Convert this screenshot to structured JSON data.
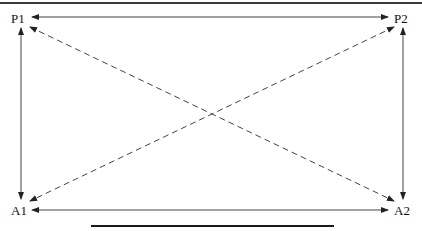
{
  "diagram": {
    "nodes": [
      {
        "id": "P1",
        "label": "P1",
        "x": 21,
        "y": 17
      },
      {
        "id": "P2",
        "label": "P2",
        "x": 403,
        "y": 17
      },
      {
        "id": "A1",
        "label": "A1",
        "x": 21,
        "y": 210
      },
      {
        "id": "A2",
        "label": "A2",
        "x": 403,
        "y": 210
      }
    ],
    "edges": [
      {
        "from": "P1",
        "to": "P2",
        "style": "solid",
        "direction": "both"
      },
      {
        "from": "A1",
        "to": "A2",
        "style": "solid",
        "direction": "both"
      },
      {
        "from": "P1",
        "to": "A1",
        "style": "solid",
        "direction": "both"
      },
      {
        "from": "P2",
        "to": "A2",
        "style": "solid",
        "direction": "both"
      },
      {
        "from": "P1",
        "to": "A2",
        "style": "dashed",
        "direction": "both"
      },
      {
        "from": "P2",
        "to": "A1",
        "style": "dashed",
        "direction": "both"
      }
    ],
    "colors": {
      "line": "#333333",
      "text": "#111111",
      "background": "#ffffff"
    }
  }
}
